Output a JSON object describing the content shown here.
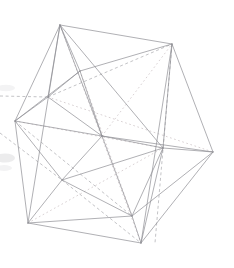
{
  "figure": {
    "projection": "orthographic wireframe line drawing",
    "background_color": "#ffffff",
    "solid_edge_color": "#8e8e93",
    "dashed_edge_color": "#a9a9ae",
    "dotted_edge_color": "#cfc6c9",
    "stroke_width": 0.7,
    "canvas": {
      "width": 234,
      "height": 268
    }
  },
  "chart_data": {
    "type": "scatter",
    "xlabel": "",
    "ylabel": "",
    "xlim": [
      0,
      234
    ],
    "ylim": [
      0,
      268
    ],
    "grid": false,
    "legend": "none",
    "vertices": [
      {
        "id": "v0",
        "name": "top-apex",
        "x": 60,
        "y": 25
      },
      {
        "id": "v1",
        "name": "upper-right",
        "x": 172,
        "y": 44
      },
      {
        "id": "v2",
        "name": "left",
        "x": 15,
        "y": 121
      },
      {
        "id": "v3",
        "name": "right",
        "x": 213,
        "y": 152
      },
      {
        "id": "v4",
        "name": "bottom-left",
        "x": 28,
        "y": 223
      },
      {
        "id": "v5",
        "name": "bottom-right",
        "x": 141,
        "y": 243
      },
      {
        "id": "v6",
        "name": "upper-mid-front",
        "x": 80,
        "y": 71
      },
      {
        "id": "v7",
        "name": "inner-center",
        "x": 102,
        "y": 136
      },
      {
        "id": "v8",
        "name": "inner-right",
        "x": 163,
        "y": 148
      },
      {
        "id": "v9",
        "name": "inner-lower-left",
        "x": 62,
        "y": 180
      },
      {
        "id": "v10",
        "name": "lower-mid",
        "x": 132,
        "y": 216
      },
      {
        "id": "v11",
        "name": "upper-back-left",
        "x": 48,
        "y": 97
      }
    ],
    "edges_solid": [
      [
        "v0",
        "v1"
      ],
      [
        "v0",
        "v2"
      ],
      [
        "v0",
        "v6"
      ],
      [
        "v0",
        "v11"
      ],
      [
        "v0",
        "v7"
      ],
      [
        "v0",
        "v8"
      ],
      [
        "v0",
        "v4"
      ],
      [
        "v1",
        "v6"
      ],
      [
        "v1",
        "v3"
      ],
      [
        "v1",
        "v8"
      ],
      [
        "v1",
        "v5"
      ],
      [
        "v2",
        "v6"
      ],
      [
        "v2",
        "v11"
      ],
      [
        "v2",
        "v7"
      ],
      [
        "v2",
        "v9"
      ],
      [
        "v2",
        "v4"
      ],
      [
        "v3",
        "v8"
      ],
      [
        "v3",
        "v10"
      ],
      [
        "v3",
        "v5"
      ],
      [
        "v3",
        "v7"
      ],
      [
        "v4",
        "v9"
      ],
      [
        "v4",
        "v10"
      ],
      [
        "v4",
        "v5"
      ],
      [
        "v5",
        "v10"
      ],
      [
        "v5",
        "v8"
      ],
      [
        "v6",
        "v7"
      ],
      [
        "v6",
        "v11"
      ],
      [
        "v7",
        "v8"
      ],
      [
        "v7",
        "v9"
      ],
      [
        "v7",
        "v10"
      ],
      [
        "v8",
        "v10"
      ],
      [
        "v8",
        "v9"
      ],
      [
        "v9",
        "v10"
      ]
    ],
    "edges_dashed": [
      [
        "v1",
        "v5"
      ],
      [
        "v2",
        "v10"
      ],
      [
        "v11",
        "v1"
      ],
      [
        "left-edge",
        "v2"
      ]
    ],
    "edges_dotted": [
      [
        "v0",
        "v5"
      ],
      [
        "v6",
        "v10"
      ],
      [
        "v2",
        "v8"
      ],
      [
        "v11",
        "v3"
      ],
      [
        "v4",
        "v8"
      ]
    ],
    "values": [
      25,
      44,
      121,
      152,
      223,
      243,
      71,
      136,
      148,
      180,
      216,
      97
    ],
    "categories": [
      "v0",
      "v1",
      "v2",
      "v3",
      "v4",
      "v5",
      "v6",
      "v7",
      "v8",
      "v9",
      "v10",
      "v11"
    ]
  },
  "annotations": {
    "edge_count_solid": 33,
    "edge_count_dashed": 4,
    "edge_count_dotted": 5,
    "vertex_count": 12
  }
}
